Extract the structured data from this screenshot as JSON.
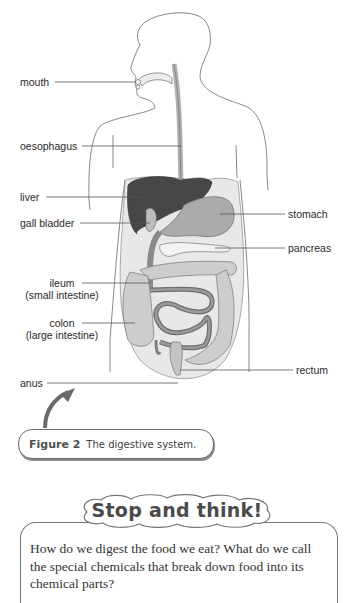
{
  "figure": {
    "title": "Figure 2",
    "caption": "The digestive system.",
    "labels": {
      "mouth": "mouth",
      "oesophagus": "oesophagus",
      "liver": "liver",
      "gall_bladder": "gall bladder",
      "stomach": "stomach",
      "pancreas": "pancreas",
      "ileum": "ileum",
      "ileum_sub": "(small intestine)",
      "colon": "colon",
      "colon_sub": "(large intestine)",
      "rectum": "rectum",
      "anus": "anus"
    },
    "colors": {
      "outline": "#6e6e6e",
      "liver": "#4a4a4a",
      "organ_mid": "#a9a9a9",
      "organ_light": "#cfcfcf",
      "abdomen_fill": "#e6e6e6",
      "small_intestine": "#7a7a7a"
    }
  },
  "stop_and_think": {
    "title": "Stop and think!",
    "body": "How do we digest the food we eat? What do we call the special chemicals that break down food into its chemical parts?"
  }
}
